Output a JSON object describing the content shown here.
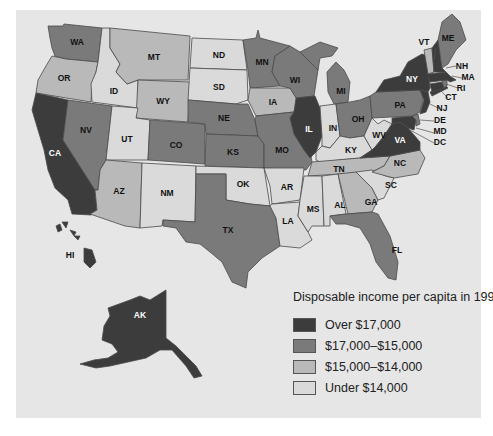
{
  "title": "Disposable income per capita in 1991",
  "colors": {
    "over_17000": "#3c3c3c",
    "17000_15000": "#7a7a7a",
    "15000_14000": "#b9b9b9",
    "under_14000": "#dadada",
    "background": "#e6e6e6"
  },
  "legend": {
    "title": "Disposable income per capita in 1991",
    "items": [
      {
        "key": "over_17000",
        "label": "Over $17,000",
        "color": "#3c3c3c"
      },
      {
        "key": "17000_15000",
        "label": "$17,000–$15,000",
        "color": "#7a7a7a"
      },
      {
        "key": "15000_14000",
        "label": "$15,000–$14,000",
        "color": "#b9b9b9"
      },
      {
        "key": "under_14000",
        "label": "Under $14,000",
        "color": "#dadada"
      }
    ]
  },
  "states": {
    "WA": "17000_15000",
    "OR": "15000_14000",
    "CA": "over_17000",
    "ID": "under_14000",
    "NV": "17000_15000",
    "MT": "15000_14000",
    "WY": "15000_14000",
    "UT": "under_14000",
    "AZ": "15000_14000",
    "CO": "17000_15000",
    "NM": "under_14000",
    "ND": "under_14000",
    "SD": "under_14000",
    "NE": "17000_15000",
    "KS": "17000_15000",
    "OK": "under_14000",
    "TX": "17000_15000",
    "MN": "17000_15000",
    "IA": "15000_14000",
    "MO": "17000_15000",
    "AR": "under_14000",
    "LA": "under_14000",
    "WI": "17000_15000",
    "IL": "over_17000",
    "MI": "17000_15000",
    "IN": "under_14000",
    "OH": "17000_15000",
    "KY": "under_14000",
    "TN": "15000_14000",
    "MS": "under_14000",
    "AL": "under_14000",
    "GA": "15000_14000",
    "FL": "17000_15000",
    "SC": "under_14000",
    "NC": "15000_14000",
    "VA": "over_17000",
    "WV": "under_14000",
    "PA": "17000_15000",
    "NY": "over_17000",
    "VT": "15000_14000",
    "ME": "17000_15000",
    "NH": "over_17000",
    "MA": "over_17000",
    "RI": "17000_15000",
    "CT": "over_17000",
    "NJ": "over_17000",
    "DE": "17000_15000",
    "MD": "over_17000",
    "DC": "over_17000",
    "AK": "over_17000",
    "HI": "over_17000"
  },
  "labels": {
    "WA": "WA",
    "OR": "OR",
    "CA": "CA",
    "ID": "ID",
    "NV": "NV",
    "MT": "MT",
    "WY": "WY",
    "UT": "UT",
    "AZ": "AZ",
    "CO": "CO",
    "NM": "NM",
    "ND": "ND",
    "SD": "SD",
    "NE": "NE",
    "KS": "KS",
    "OK": "OK",
    "TX": "TX",
    "MN": "MN",
    "IA": "IA",
    "MO": "MO",
    "AR": "AR",
    "LA": "LA",
    "WI": "WI",
    "IL": "IL",
    "MI": "MI",
    "IN": "IN",
    "OH": "OH",
    "KY": "KY",
    "TN": "TN",
    "MS": "MS",
    "AL": "AL",
    "GA": "GA",
    "FL": "FL",
    "SC": "SC",
    "NC": "NC",
    "VA": "VA",
    "WV": "WV",
    "PA": "PA",
    "NY": "NY",
    "VT": "VT",
    "ME": "ME",
    "NH": "NH",
    "MA": "MA",
    "RI": "RI",
    "CT": "CT",
    "NJ": "NJ",
    "DE": "DE",
    "MD": "MD",
    "DC": "DC",
    "AK": "AK",
    "HI": "HI"
  }
}
